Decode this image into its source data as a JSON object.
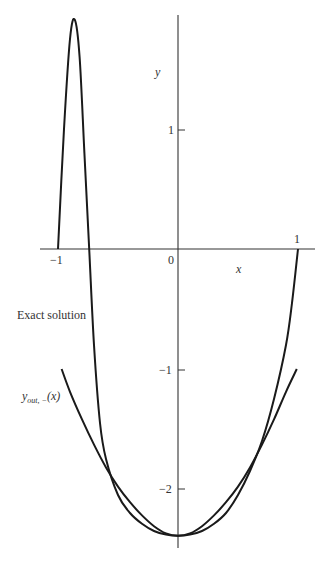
{
  "chart_data": {
    "type": "line",
    "title": "",
    "xlabel": "x",
    "ylabel": "y",
    "xlim": [
      -1.15,
      1.15
    ],
    "ylim": [
      -2.5,
      1.95
    ],
    "grid": false,
    "x_ticks": [
      {
        "value": -1,
        "label": "−1"
      },
      {
        "value": 0,
        "label": "0"
      },
      {
        "value": 1,
        "label": "1"
      }
    ],
    "y_ticks": [
      {
        "value": 1,
        "label": "1"
      },
      {
        "value": -1,
        "label": "−1"
      },
      {
        "value": -2,
        "label": "−2"
      }
    ],
    "series": [
      {
        "name": "Exact solution",
        "x": [
          -1.0,
          -0.95,
          -0.9,
          -0.86,
          -0.82,
          -0.78,
          -0.74,
          -0.7,
          -0.65,
          -0.6,
          -0.5,
          -0.4,
          -0.3,
          -0.2,
          -0.1,
          0.0,
          0.1,
          0.2,
          0.3,
          0.4,
          0.5,
          0.6,
          0.7,
          0.8,
          0.9,
          0.95,
          1.0
        ],
        "y": [
          0.0,
          1.0,
          1.75,
          1.91,
          1.6,
          0.8,
          0.0,
          -0.8,
          -1.45,
          -1.75,
          -2.05,
          -2.2,
          -2.29,
          -2.35,
          -2.38,
          -2.39,
          -2.38,
          -2.35,
          -2.29,
          -2.2,
          -2.05,
          -1.85,
          -1.6,
          -1.25,
          -0.8,
          -0.45,
          0.0
        ]
      },
      {
        "name": "y_out,−(x)",
        "x": [
          -0.97,
          -0.9,
          -0.8,
          -0.7,
          -0.6,
          -0.5,
          -0.4,
          -0.3,
          -0.2,
          -0.1,
          0.0,
          0.1,
          0.2,
          0.3,
          0.4,
          0.5,
          0.6,
          0.7,
          0.8,
          0.9,
          0.99
        ],
        "y": [
          -1.0,
          -1.19,
          -1.42,
          -1.63,
          -1.82,
          -1.98,
          -2.11,
          -2.22,
          -2.31,
          -2.37,
          -2.39,
          -2.37,
          -2.31,
          -2.22,
          -2.11,
          -1.98,
          -1.82,
          -1.63,
          -1.42,
          -1.19,
          -1.0
        ]
      }
    ],
    "annotations": [
      {
        "text": "Exact solution",
        "x": -1.35,
        "y": -0.55
      },
      {
        "text": "y_out,−(x)",
        "x": -1.35,
        "y": -1.25
      }
    ]
  },
  "labels": {
    "y_axis": "y",
    "x_axis": "x",
    "origin": "0",
    "x_neg1": "−1",
    "x_pos1": "1",
    "y_pos1": "1",
    "y_neg1": "−1",
    "y_neg2": "−2",
    "exact": "Exact solution",
    "yout_main": "y",
    "yout_sub": "out, −",
    "yout_arg": "(x)"
  },
  "colors": {
    "curve": "#1a1a1a",
    "axis": "#333333",
    "background": "#ffffff"
  }
}
